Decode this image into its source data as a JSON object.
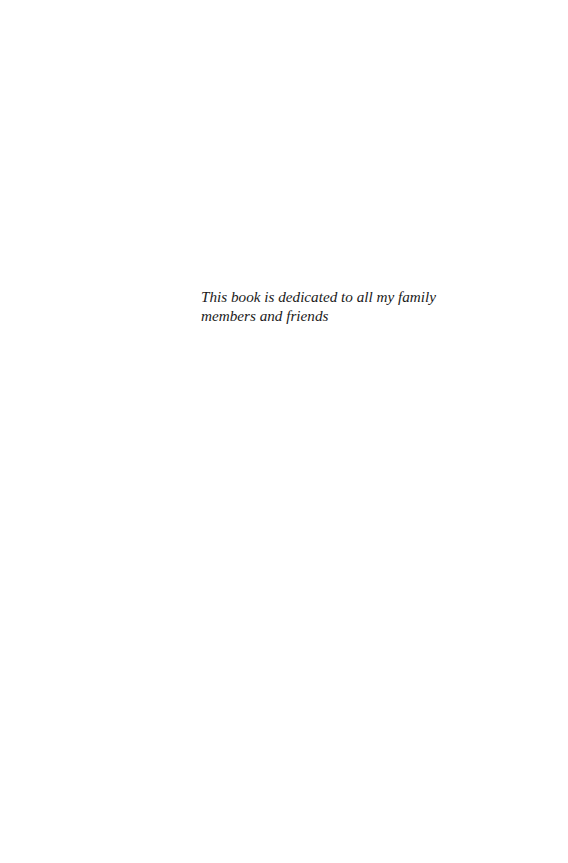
{
  "page": {
    "background_color": "#ffffff",
    "text_color": "#1a1a1a"
  },
  "dedication": {
    "lines": [
      "This book is dedicated to all my family",
      "members and friends"
    ],
    "full_text": "This book is dedicated to all my family members and friends"
  }
}
